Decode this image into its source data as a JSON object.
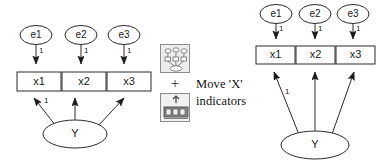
{
  "figure": {
    "type": "path-diagram-transformation",
    "background": "#ffffff",
    "stroke_color": "#2b2b2b"
  },
  "left_diagram": {
    "name": "before-diagram",
    "error_nodes": [
      {
        "id": "e1",
        "label": "e1",
        "cx": 36,
        "cy": 35,
        "rx": 16,
        "ry": 9.5
      },
      {
        "id": "e2",
        "label": "e2",
        "cx": 81,
        "cy": 35,
        "rx": 16,
        "ry": 9.5
      },
      {
        "id": "e3",
        "label": "e3",
        "cx": 124,
        "cy": 35,
        "rx": 16,
        "ry": 9.5
      }
    ],
    "indicator_boxes": [
      {
        "id": "x1",
        "label": "x1",
        "x": 17,
        "y": 72,
        "w": 44,
        "h": 19
      },
      {
        "id": "x2",
        "label": "x2",
        "x": 62,
        "y": 72,
        "w": 44,
        "h": 19
      },
      {
        "id": "x3",
        "label": "x3",
        "x": 107,
        "y": 72,
        "w": 44,
        "h": 19
      }
    ],
    "latent_node": {
      "id": "Y",
      "label": "Y",
      "cx": 75,
      "cy": 134,
      "rx": 32,
      "ry": 14
    },
    "error_edges": [
      {
        "from": "e1",
        "to": "x1",
        "weight": "1"
      },
      {
        "from": "e2",
        "to": "x2",
        "weight": "1"
      },
      {
        "from": "e3",
        "to": "x3",
        "weight": "1"
      }
    ],
    "loading_edges": [
      {
        "from": "Y",
        "to": "x1",
        "weight": "1"
      },
      {
        "from": "Y",
        "to": "x2",
        "weight": ""
      },
      {
        "from": "Y",
        "to": "x3",
        "weight": ""
      }
    ]
  },
  "middle": {
    "name": "action-column",
    "icons": [
      {
        "id": "path-diagram-icon",
        "label": "path-diagram-tool-icon"
      },
      {
        "id": "move-object-icon",
        "label": "move-object-tool-icon"
      }
    ],
    "operator": "+",
    "caption_lines": [
      "Move 'X'",
      "indicators"
    ]
  },
  "right_diagram": {
    "name": "after-diagram",
    "error_nodes": [
      {
        "id": "e1",
        "label": "e1",
        "cx": 276,
        "cy": 14,
        "rx": 16,
        "ry": 9.5
      },
      {
        "id": "e2",
        "label": "e2",
        "cx": 315,
        "cy": 14,
        "rx": 16,
        "ry": 9.5
      },
      {
        "id": "e3",
        "label": "e3",
        "cx": 353,
        "cy": 14,
        "rx": 16,
        "ry": 9.5
      }
    ],
    "indicator_boxes": [
      {
        "id": "x1",
        "label": "x1",
        "x": 256,
        "y": 46,
        "w": 39,
        "h": 18
      },
      {
        "id": "x2",
        "label": "x2",
        "x": 296,
        "y": 46,
        "w": 39,
        "h": 18
      },
      {
        "id": "x3",
        "label": "x3",
        "x": 336,
        "y": 46,
        "w": 39,
        "h": 18
      }
    ],
    "latent_node": {
      "id": "Y",
      "label": "Y",
      "cx": 315,
      "cy": 145,
      "rx": 34,
      "ry": 14
    },
    "error_edges": [
      {
        "from": "e1",
        "to": "x1",
        "weight": "1"
      },
      {
        "from": "e2",
        "to": "x2",
        "weight": "1"
      },
      {
        "from": "e3",
        "to": "x3",
        "weight": "1"
      }
    ],
    "loading_edges": [
      {
        "from": "Y",
        "to": "x1",
        "weight": "1"
      },
      {
        "from": "Y",
        "to": "x2",
        "weight": ""
      },
      {
        "from": "Y",
        "to": "x3",
        "weight": ""
      }
    ]
  }
}
